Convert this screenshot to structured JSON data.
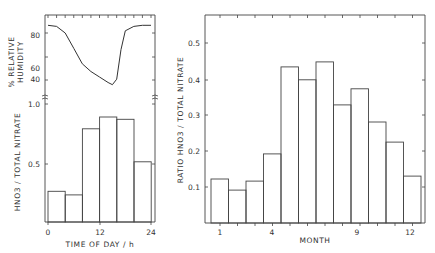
{
  "chart_data": [
    {
      "type": "line",
      "panel": "top-left",
      "title": "",
      "xlabel": "",
      "ylabel": "% RELATIVE HUMIDITY",
      "yticks": [
        "40",
        "60",
        "80"
      ],
      "ylim": [
        30,
        95
      ],
      "xlim": [
        0,
        24
      ],
      "x": [
        0,
        2,
        4,
        6,
        8,
        10,
        12,
        14,
        15,
        16,
        17,
        18,
        20,
        22,
        24
      ],
      "values": [
        87,
        86,
        80,
        66,
        52,
        45,
        40,
        35,
        33,
        38,
        65,
        82,
        86,
        87,
        87
      ]
    },
    {
      "type": "bar",
      "panel": "bottom-left",
      "title": "",
      "xlabel": "TIME OF DAY / h",
      "ylabel": "HNO3 / TOTAL NITRATE",
      "xticks": [
        "0",
        "12",
        "24"
      ],
      "yticks": [
        "0.5",
        "1.0"
      ],
      "ylim": [
        0,
        1.0
      ],
      "categories": [
        "0-4",
        "4-8",
        "8-12",
        "12-16",
        "16-20",
        "20-24"
      ],
      "values": [
        0.26,
        0.23,
        0.79,
        0.89,
        0.87,
        0.51
      ]
    },
    {
      "type": "bar",
      "panel": "right",
      "title": "",
      "xlabel": "MONTH",
      "ylabel": "RATIO HNO3 / TOTAL NITRATE",
      "xticks": [
        "1",
        "4",
        "9",
        "12"
      ],
      "yticks": [
        "0.1",
        "0.2",
        "0.3",
        "0.4",
        "0.5"
      ],
      "ylim": [
        0,
        0.58
      ],
      "categories": [
        "1",
        "2",
        "3",
        "4",
        "5",
        "6",
        "7",
        "8",
        "9",
        "10",
        "11",
        "12"
      ],
      "values": [
        0.123,
        0.092,
        0.117,
        0.193,
        0.436,
        0.4,
        0.45,
        0.33,
        0.375,
        0.282,
        0.226,
        0.131
      ]
    }
  ],
  "labels": {
    "rh_ylabel_1": "% RELATIVE",
    "rh_ylabel_2": "HUMIDITY",
    "left_ylabel": "HNO3 / TOTAL NITRATE",
    "left_xlabel": "TIME OF DAY / h",
    "right_ylabel": "RATIO HNO3 / TOTAL NITRATE",
    "right_xlabel": "MONTH"
  }
}
